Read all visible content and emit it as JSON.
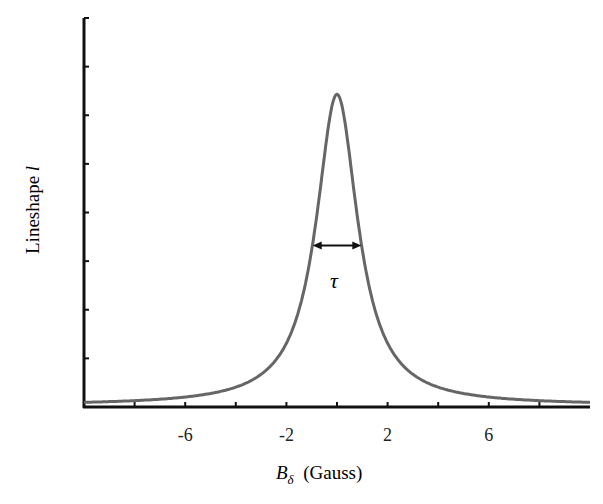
{
  "chart_data": {
    "type": "line",
    "title": "",
    "xlabel": "B_δ (Gauss)",
    "xlabel_symbol": "B",
    "xlabel_subscript": "δ",
    "xlabel_units": "(Gauss)",
    "ylabel": "Lineshape l",
    "ylabel_text": "Lineshape ",
    "ylabel_symbol": "l",
    "xlim": [
      -10,
      10
    ],
    "ylim": [
      0,
      1
    ],
    "x_ticks": [
      -8,
      -6,
      -4,
      -2,
      0,
      2,
      4,
      6,
      8
    ],
    "x_tick_labels": [
      "-6",
      "-2",
      "2",
      "6"
    ],
    "x_tick_label_values": [
      -6,
      -2,
      2,
      6
    ],
    "y_ticks": [
      0,
      0.125,
      0.25,
      0.375,
      0.5,
      0.625,
      0.75,
      0.875,
      1.0
    ],
    "y_tick_labels": [],
    "grid": false,
    "legend": null,
    "series": [
      {
        "name": "Lorentzian lineshape",
        "color": "#666666",
        "x": [
          -10,
          -9,
          -8,
          -7,
          -6,
          -5,
          -4,
          -3,
          -2,
          -1.5,
          -1,
          -0.5,
          0,
          0.5,
          1,
          1.5,
          2,
          3,
          4,
          5,
          6,
          7,
          8,
          9,
          10
        ],
        "y": [
          0.008,
          0.01,
          0.012,
          0.016,
          0.022,
          0.031,
          0.047,
          0.08,
          0.16,
          0.245,
          0.4,
          0.64,
          0.8,
          0.64,
          0.4,
          0.245,
          0.16,
          0.08,
          0.047,
          0.031,
          0.022,
          0.016,
          0.012,
          0.01,
          0.008
        ]
      }
    ],
    "annotations": [
      {
        "type": "double-arrow",
        "label": "τ",
        "from_x": -1,
        "to_x": 1,
        "y": 0.4,
        "meaning": "full width at half maximum"
      }
    ],
    "peak": {
      "x": 0,
      "y": 0.8
    },
    "fwhm": 2
  }
}
